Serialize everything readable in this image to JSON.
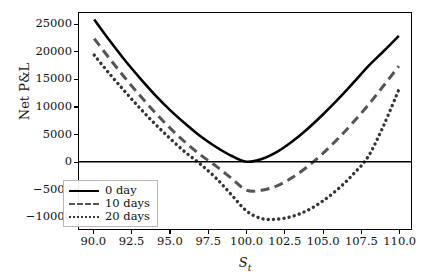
{
  "chart_data": {
    "type": "line",
    "title": "",
    "subtitle": "",
    "xlabel": "S_t",
    "xlabel_base": "S",
    "xlabel_sub": "t",
    "ylabel": "Net P&L",
    "xlim": [
      89.0,
      110.8
    ],
    "ylim": [
      -12300,
      27200
    ],
    "xticks": [
      90.0,
      92.5,
      95.0,
      97.5,
      100.0,
      102.5,
      105.0,
      107.5,
      110.0
    ],
    "xtick_labels": [
      "90.0",
      "92.5",
      "95.0",
      "97.5",
      "100.0",
      "102.5",
      "105.0",
      "107.5",
      "110.0"
    ],
    "yticks": [
      25000,
      20000,
      15000,
      10000,
      5000,
      0,
      -5000,
      -10000
    ],
    "ytick_labels": [
      "25000",
      "20000",
      "15000",
      "10000",
      "5000",
      "0",
      "−5000",
      "−10000"
    ],
    "grid": false,
    "legend_position": "lower left",
    "zero_line": true,
    "x": [
      90.0,
      91.0,
      92.0,
      93.0,
      94.0,
      95.0,
      96.0,
      97.0,
      98.0,
      99.0,
      100.0,
      101.0,
      102.0,
      103.0,
      104.0,
      105.0,
      106.0,
      107.0,
      108.0,
      109.0,
      110.0
    ],
    "series": [
      {
        "name": "0 day",
        "style": "solid",
        "color": "#000000",
        "values": [
          26000,
          22200,
          18600,
          15300,
          12200,
          9400,
          6900,
          4600,
          2700,
          1100,
          0,
          500,
          1800,
          3700,
          6000,
          8600,
          11400,
          14400,
          17500,
          20200,
          23000
        ],
        "min_value": 0,
        "min_x": 100.0,
        "zero_crossings": [
          100.0
        ]
      },
      {
        "name": "10 days",
        "style": "dashed",
        "color": "#555555",
        "values": [
          22500,
          18900,
          15400,
          12100,
          9000,
          6100,
          3500,
          1200,
          -800,
          -3000,
          -5200,
          -5200,
          -4400,
          -2900,
          -900,
          1500,
          4200,
          7200,
          10400,
          13900,
          17500
        ],
        "min_value": -5200,
        "min_x": 100.3,
        "zero_crossings": [
          95.8,
          104.5
        ]
      },
      {
        "name": "20 days",
        "style": "dotted",
        "color": "#353535",
        "values": [
          19500,
          16100,
          12900,
          9800,
          6900,
          4200,
          1700,
          -500,
          -3000,
          -6000,
          -9000,
          -10400,
          -10500,
          -10000,
          -8900,
          -7200,
          -5000,
          -2300,
          1000,
          6600,
          13200
        ],
        "min_value": -10500,
        "min_x": 100.6,
        "zero_crossings": [
          94.2,
          106.7
        ]
      }
    ],
    "legend_entries": [
      "0 day",
      "10 days",
      "20 days"
    ]
  },
  "figure": {
    "background_color": "#ffffff",
    "frame_color": "#000000",
    "text_color": "#111111"
  }
}
